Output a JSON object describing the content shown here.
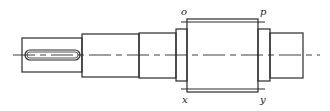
{
  "diagram": {
    "stroke_color": "#2a2a2a",
    "labels": {
      "top_left": "o",
      "top_right": "p",
      "bottom_left": "x",
      "bottom_right": "y"
    },
    "parts": [
      {
        "name": "keyed-end-segment",
        "x": 22,
        "y": 38,
        "w": 60,
        "h": 34
      },
      {
        "name": "second-segment",
        "x": 82,
        "y": 34,
        "w": 57,
        "h": 43
      },
      {
        "name": "third-segment",
        "x": 139,
        "y": 33,
        "w": 37,
        "h": 45
      },
      {
        "name": "left-collar",
        "x": 176,
        "y": 29,
        "w": 11,
        "h": 52
      },
      {
        "name": "main-body",
        "x": 187,
        "y": 19,
        "w": 71,
        "h": 73
      },
      {
        "name": "right-collar",
        "x": 258,
        "y": 29,
        "w": 12,
        "h": 52
      },
      {
        "name": "right-end-segment",
        "x": 270,
        "y": 33,
        "w": 33,
        "h": 45
      }
    ],
    "keyway": {
      "x": 25,
      "y": 50,
      "w": 55,
      "h": 10
    },
    "centerline": {
      "x1": 13,
      "x2": 320,
      "y": 55
    }
  }
}
